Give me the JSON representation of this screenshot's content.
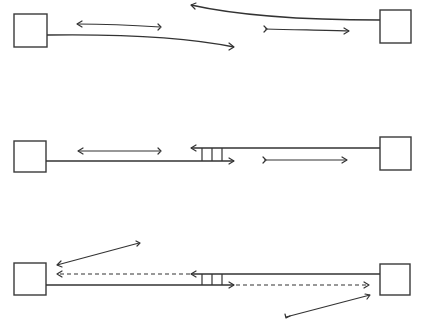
{
  "diagram": {
    "type": "network-link-timing",
    "colors": {
      "stroke": "#333333",
      "background": "#ffffff"
    },
    "panels": [
      {
        "id": "top",
        "description": "Two endpoints connected by separate curved links; messages travel independently",
        "left_box": {
          "x": 14,
          "y": 14,
          "w": 33,
          "h": 33
        },
        "right_box": {
          "x": 380,
          "y": 10,
          "w": 31,
          "h": 33
        },
        "links": [
          {
            "from": [
              47,
              35
            ],
            "to": [
              234,
              47
            ],
            "curve": true,
            "arrow": "end"
          },
          {
            "from": [
              380,
              20
            ],
            "to": [
              191,
              5
            ],
            "curve": true,
            "arrow": "end"
          }
        ],
        "messages": [
          {
            "from": [
              160,
              27
            ],
            "to": [
              77,
              24
            ],
            "style": "solid",
            "direction": "left"
          },
          {
            "from": [
              265,
              29
            ],
            "to": [
              349,
              31
            ],
            "style": "solid",
            "direction": "right"
          }
        ]
      },
      {
        "id": "middle",
        "description": "Two endpoints joined by parallel straight lines with a ladder (3 rungs) in the middle",
        "left_box": {
          "x": 14,
          "y": 141,
          "w": 32,
          "h": 31
        },
        "right_box": {
          "x": 380,
          "y": 137,
          "w": 31,
          "h": 33
        },
        "links": [
          {
            "from": [
              46,
              161
            ],
            "to": [
              234,
              161
            ],
            "arrow": "end"
          },
          {
            "from": [
              380,
              148
            ],
            "to": [
              191,
              148
            ],
            "arrow": "end"
          }
        ],
        "ladder": {
          "x": [
            202,
            212,
            222
          ],
          "y_top": 148,
          "y_bottom": 161
        },
        "messages": [
          {
            "from": [
              160,
              151
            ],
            "to": [
              78,
              151
            ],
            "style": "solid",
            "direction": "left"
          },
          {
            "from": [
              264,
              160
            ],
            "to": [
              347,
              160
            ],
            "style": "solid",
            "direction": "right"
          }
        ]
      },
      {
        "id": "bottom",
        "description": "Same ladder topology with dashed in-flight messages and diagonal arrows to endpoints",
        "left_box": {
          "x": 14,
          "y": 263,
          "w": 32,
          "h": 32
        },
        "right_box": {
          "x": 380,
          "y": 264,
          "w": 30,
          "h": 31
        },
        "links": [
          {
            "from": [
              46,
              285
            ],
            "to": [
              234,
              285
            ],
            "arrow": "end"
          },
          {
            "from": [
              380,
              274
            ],
            "to": [
              191,
              274
            ],
            "arrow": "end"
          }
        ],
        "ladder": {
          "x": [
            202,
            212,
            222
          ],
          "y_top": 274,
          "y_bottom": 285
        },
        "messages": [
          {
            "from": [
              191,
              274
            ],
            "to": [
              56,
              274
            ],
            "style": "dashed",
            "direction": "left"
          },
          {
            "from": [
              234,
              285
            ],
            "to": [
              369,
              285
            ],
            "style": "dashed",
            "direction": "right"
          },
          {
            "from": [
              139,
              243
            ],
            "to": [
              57,
              265
            ],
            "style": "solid",
            "direction": "left",
            "tail_hook": true
          },
          {
            "from": [
              286,
              317
            ],
            "to": [
              370,
              295
            ],
            "style": "solid",
            "direction": "right",
            "tail_hook": true
          }
        ]
      }
    ]
  }
}
